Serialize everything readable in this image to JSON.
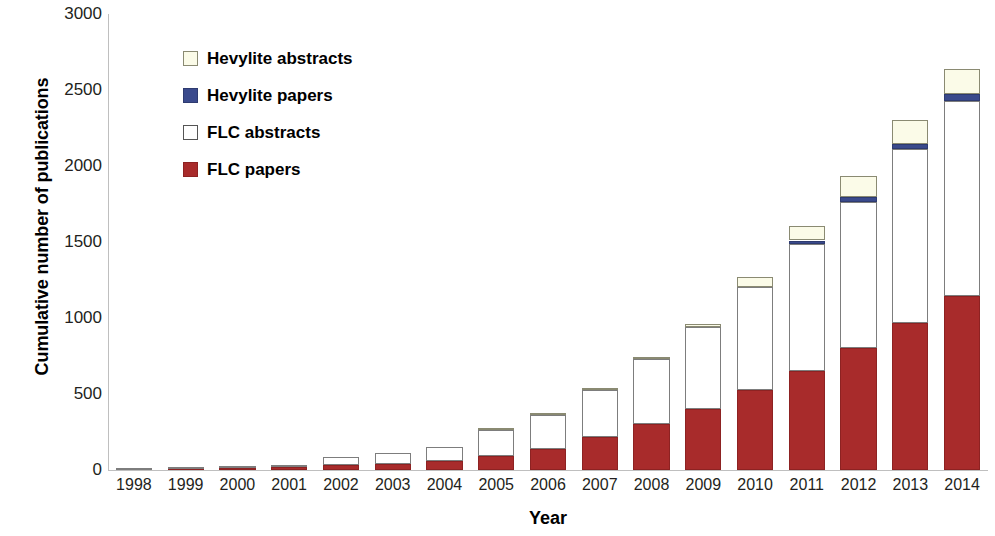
{
  "chart_data": {
    "type": "bar",
    "stacked": true,
    "title": "",
    "xlabel": "Year",
    "ylabel": "Cumulative number of publications",
    "categories": [
      "1998",
      "1999",
      "2000",
      "2001",
      "2002",
      "2003",
      "2004",
      "2005",
      "2006",
      "2007",
      "2008",
      "2009",
      "2010",
      "2011",
      "2012",
      "2013",
      "2014"
    ],
    "ylim": [
      0,
      3000
    ],
    "ytick_labels": [
      "0",
      "500",
      "1000",
      "1500",
      "2000",
      "2500",
      "3000"
    ],
    "ytick_values": [
      0,
      500,
      1000,
      1500,
      2000,
      2500,
      3000
    ],
    "grid": false,
    "legend_position": "upper left inside",
    "series": [
      {
        "name": "FLC papers",
        "color": "#a82b2b",
        "values": [
          2,
          6,
          10,
          18,
          30,
          42,
          62,
          90,
          140,
          215,
          300,
          400,
          525,
          650,
          805,
          965,
          1145
        ]
      },
      {
        "name": "FLC abstracts",
        "color": "#ffffff",
        "values": [
          2,
          6,
          10,
          18,
          55,
          70,
          90,
          175,
          220,
          310,
          430,
          540,
          680,
          840,
          960,
          1145,
          1285
        ]
      },
      {
        "name": "Hevylite papers",
        "color": "#3a4a8c",
        "values": [
          0,
          0,
          0,
          0,
          0,
          0,
          0,
          0,
          0,
          0,
          0,
          0,
          0,
          20,
          28,
          35,
          45
        ]
      },
      {
        "name": "Hevylite abstracts",
        "color": "#fbfbe8",
        "values": [
          0,
          0,
          0,
          0,
          0,
          0,
          0,
          5,
          8,
          12,
          15,
          18,
          65,
          95,
          140,
          160,
          165
        ]
      }
    ],
    "totals": [
      4,
      12,
      20,
      36,
      85,
      112,
      152,
      270,
      368,
      537,
      745,
      958,
      1270,
      1605,
      1933,
      2305,
      2640
    ]
  },
  "axes": {
    "y_title": "Cumulative number of publications",
    "x_title": "Year"
  },
  "legend": {
    "items": [
      {
        "label": "Hevylite abstracts",
        "swatch": "hev-abstracts"
      },
      {
        "label": "Hevylite papers",
        "swatch": "hev-papers"
      },
      {
        "label": "FLC abstracts",
        "swatch": "flc-abstracts"
      },
      {
        "label": "FLC papers",
        "swatch": "flc-papers"
      }
    ]
  }
}
